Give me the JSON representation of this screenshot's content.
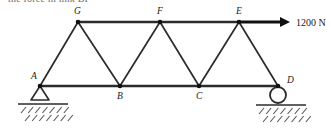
{
  "header": {
    "text": "the force in link BF"
  },
  "diagram": {
    "load": {
      "label": "1200 N",
      "magnitude": 1200,
      "unit": "N",
      "direction": "right",
      "applied_at": "E"
    },
    "nodes": [
      {
        "id": "A",
        "label": "A",
        "x": 40,
        "y": 86,
        "label_x": 31,
        "label_y": 79,
        "chord": "bottom",
        "support": "pin"
      },
      {
        "id": "B",
        "label": "B",
        "x": 120,
        "y": 86,
        "label_x": 117,
        "label_y": 99,
        "chord": "bottom",
        "support": "none"
      },
      {
        "id": "C",
        "label": "C",
        "x": 199,
        "y": 86,
        "label_x": 196,
        "label_y": 99,
        "chord": "bottom",
        "support": "none"
      },
      {
        "id": "D",
        "label": "D",
        "x": 278,
        "y": 86,
        "label_x": 287,
        "label_y": 83,
        "chord": "bottom",
        "support": "roller"
      },
      {
        "id": "E",
        "label": "E",
        "x": 239,
        "y": 22,
        "label_x": 236,
        "label_y": 14,
        "chord": "top",
        "support": "none"
      },
      {
        "id": "F",
        "label": "F",
        "x": 160,
        "y": 22,
        "label_x": 157,
        "label_y": 14,
        "chord": "top",
        "support": "none"
      },
      {
        "id": "G",
        "label": "G",
        "x": 78,
        "y": 22,
        "label_x": 74,
        "label_y": 14,
        "chord": "top",
        "support": "none"
      }
    ],
    "members": [
      {
        "id": "AB",
        "from": "A",
        "to": "B",
        "type": "chord"
      },
      {
        "id": "BC",
        "from": "B",
        "to": "C",
        "type": "chord"
      },
      {
        "id": "CD",
        "from": "C",
        "to": "D",
        "type": "chord"
      },
      {
        "id": "GF",
        "from": "G",
        "to": "F",
        "type": "chord"
      },
      {
        "id": "FE",
        "from": "F",
        "to": "E",
        "type": "chord"
      },
      {
        "id": "AG",
        "from": "A",
        "to": "G",
        "type": "diagonal"
      },
      {
        "id": "GB",
        "from": "G",
        "to": "B",
        "type": "diagonal"
      },
      {
        "id": "BF",
        "from": "B",
        "to": "F",
        "type": "diagonal"
      },
      {
        "id": "FC",
        "from": "F",
        "to": "C",
        "type": "diagonal"
      },
      {
        "id": "CE",
        "from": "C",
        "to": "E",
        "type": "diagonal"
      },
      {
        "id": "ED",
        "from": "E",
        "to": "D",
        "type": "diagonal"
      }
    ],
    "supports": {
      "pin": {
        "name": "pin-support-A",
        "at": "A",
        "ground_y": 104,
        "ground_x1": 18,
        "ground_x2": 68,
        "triangle_half_width": 9,
        "triangle_height": 14
      },
      "roller": {
        "name": "roller-support-D",
        "at": "D",
        "ground_y": 105,
        "ground_x1": 256,
        "ground_x2": 306,
        "radius": 8
      }
    },
    "arrow": {
      "x1": 239,
      "y1": 22,
      "x2": 282,
      "tip_x": 290,
      "head_half_height": 5,
      "label_x": 296,
      "label_y": 26
    }
  }
}
